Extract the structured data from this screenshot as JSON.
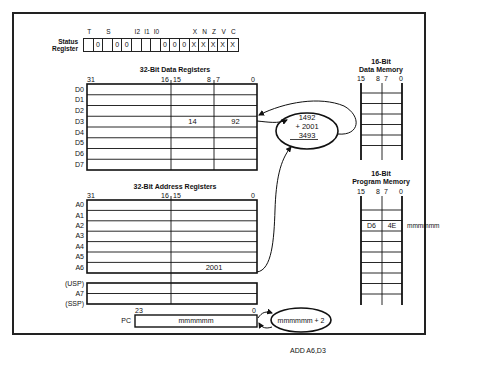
{
  "status_register": {
    "label_line1": "Status",
    "label_line2": "Register",
    "bit_labels": [
      "T",
      "",
      "S",
      "",
      "",
      "I2",
      "I1",
      "I0",
      "",
      "",
      "",
      "X",
      "N",
      "Z",
      "V",
      "C"
    ],
    "bits": [
      "",
      "0",
      "",
      "0",
      "0",
      "",
      "",
      "",
      "0",
      "0",
      "0",
      "X",
      "X",
      "X",
      "X",
      "X"
    ]
  },
  "data_registers": {
    "title": "32-Bit Data Registers",
    "bit_markers": {
      "b31": "31",
      "b16": "16",
      "b15": "15",
      "b8": "8",
      "b7": "7",
      "b0": "0"
    },
    "rows": [
      {
        "name": "D0",
        "mid": "",
        "low": ""
      },
      {
        "name": "D1",
        "mid": "",
        "low": ""
      },
      {
        "name": "D2",
        "mid": "",
        "low": ""
      },
      {
        "name": "D3",
        "mid": "14",
        "low": "92"
      },
      {
        "name": "D4",
        "mid": "",
        "low": ""
      },
      {
        "name": "D5",
        "mid": "",
        "low": ""
      },
      {
        "name": "D6",
        "mid": "",
        "low": ""
      },
      {
        "name": "D7",
        "mid": "",
        "low": ""
      }
    ]
  },
  "address_registers": {
    "title": "32-Bit Address Registers",
    "bit_markers": {
      "b31": "31",
      "b16": "16",
      "b15": "15",
      "b0": "0"
    },
    "rows": [
      {
        "name": "A0",
        "value": ""
      },
      {
        "name": "A1",
        "value": ""
      },
      {
        "name": "A2",
        "value": ""
      },
      {
        "name": "A3",
        "value": ""
      },
      {
        "name": "A4",
        "value": ""
      },
      {
        "name": "A5",
        "value": ""
      },
      {
        "name": "A6",
        "value": "2001"
      }
    ],
    "stack": {
      "usp": "(USP)",
      "a7": "A7",
      "ssp": "(SSP)"
    }
  },
  "program_counter": {
    "label": "PC",
    "bit_high": "23",
    "bit_low": "0",
    "value": "mmmmmm"
  },
  "alu_add": {
    "operand1": "1492",
    "operand2": "+ 2001",
    "result": "3493"
  },
  "pc_increment": {
    "expression": "mmmmmm + 2"
  },
  "data_memory": {
    "title_line1": "16-Bit",
    "title_line2": "Data Memory",
    "bit_markers": {
      "b15": "15",
      "b8": "8",
      "b7": "7",
      "b0": "0"
    }
  },
  "program_memory": {
    "title_line1": "16-Bit",
    "title_line2": "Program Memory",
    "bit_markers": {
      "b15": "15",
      "b8": "8",
      "b7": "7",
      "b0": "0"
    },
    "instruction": {
      "high": "D6",
      "low": "4E",
      "address": "mmmmmm"
    }
  },
  "caption": "ADD A6,D3"
}
